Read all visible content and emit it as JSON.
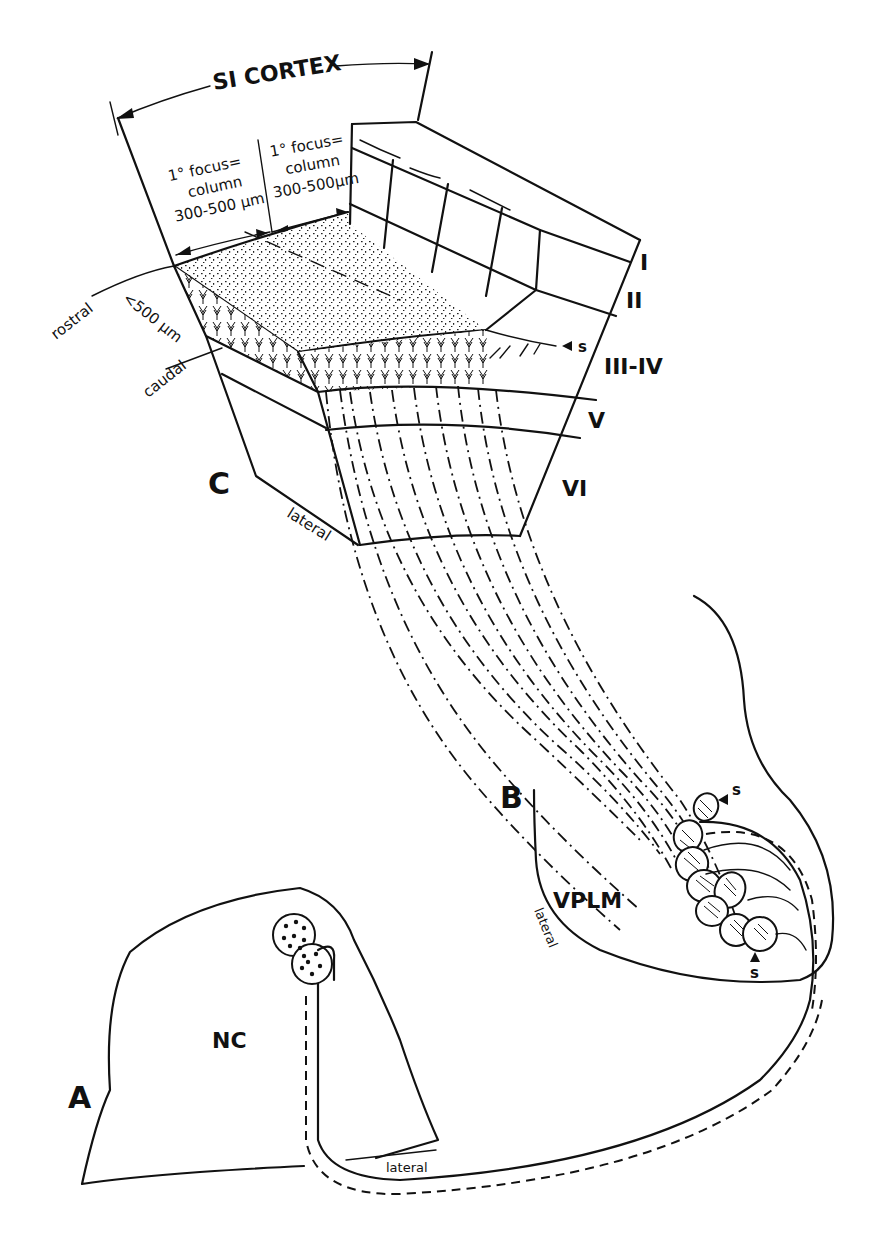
{
  "figure": {
    "title": "SI CORTEX",
    "panels": {
      "A": {
        "letter": "A",
        "structure": "NC",
        "orientation": "lateral"
      },
      "B": {
        "letter": "B",
        "structure": "VPLM",
        "orientation": "lateral",
        "markers": [
          "s",
          "s"
        ]
      },
      "C": {
        "letter": "C",
        "orientation": "lateral"
      }
    },
    "column_labels": [
      {
        "line1": "1° focus=",
        "line2": "column",
        "line3": "300-500 µm"
      },
      {
        "line1": "1° focus=",
        "line2": "column",
        "line3": "300-500µm"
      }
    ],
    "axis_labels": {
      "rostral": "rostral",
      "caudal": "caudal",
      "distance": "<500 µm"
    },
    "layers": [
      "I",
      "II",
      "III-IV",
      "V",
      "VI"
    ],
    "layer_marker": "s"
  }
}
